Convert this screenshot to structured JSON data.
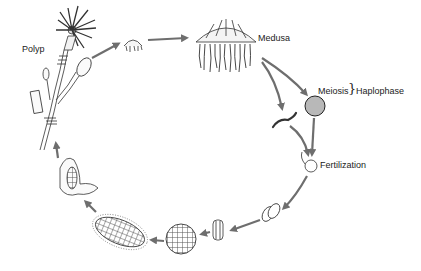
{
  "diagram": {
    "type": "life-cycle",
    "colors": {
      "arrow": "#6e6e6e",
      "line": "#333333",
      "background": "#ffffff"
    },
    "labels": {
      "polyp": "Polyp",
      "medusa": "Medusa",
      "meiosis": "Meiosis",
      "brace": "}",
      "haplophase": "Haplophase",
      "fertilization": "Fertilization"
    },
    "stages": [
      {
        "id": "polyp",
        "label": "Polyp"
      },
      {
        "id": "ephyra",
        "label": ""
      },
      {
        "id": "medusa",
        "label": "Medusa"
      },
      {
        "id": "sperm",
        "label": ""
      },
      {
        "id": "egg",
        "label": ""
      },
      {
        "id": "fertilization",
        "label": "Fertilization"
      },
      {
        "id": "two-cell",
        "label": ""
      },
      {
        "id": "four-cell",
        "label": ""
      },
      {
        "id": "blastula",
        "label": ""
      },
      {
        "id": "planula",
        "label": ""
      },
      {
        "id": "settling-planula",
        "label": ""
      }
    ],
    "sequence": [
      "polyp",
      "ephyra",
      "medusa",
      "sperm+egg",
      "fertilization",
      "two-cell",
      "four-cell",
      "blastula",
      "planula",
      "settling-planula",
      "polyp"
    ]
  }
}
